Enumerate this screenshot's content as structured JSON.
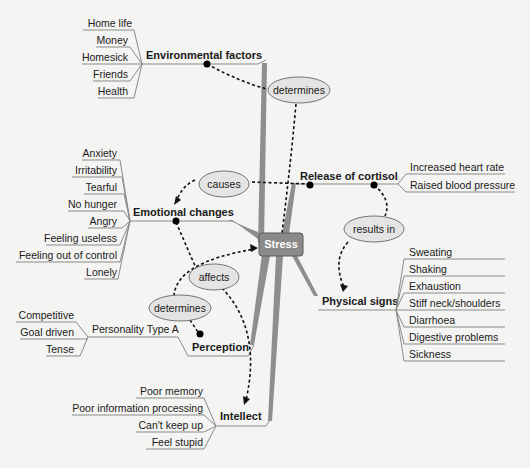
{
  "center": {
    "label": "Stress",
    "fill": "#8a8a8a"
  },
  "branches": {
    "environmental": {
      "label": "Environmental factors",
      "items": [
        "Home life",
        "Money",
        "Homesick",
        "Friends",
        "Health"
      ]
    },
    "emotional": {
      "label": "Emotional changes",
      "items": [
        "Anxiety",
        "Irritability",
        "Tearful",
        "No hunger",
        "Angry",
        "Feeling useless",
        "Feeling out of control",
        "Lonely"
      ]
    },
    "cortisol": {
      "label": "Release of cortisol",
      "items": [
        "Increased heart rate",
        "Raised blood pressure"
      ]
    },
    "physical": {
      "label": "Physical signs",
      "items": [
        "Sweating",
        "Shaking",
        "Exhaustion",
        "Stiff neck/shoulders",
        "Diarrhoea",
        "Digestive problems",
        "Sickness"
      ]
    },
    "perception": {
      "label": "Perception",
      "sub_label": "Personality Type A",
      "items": [
        "Competitive",
        "Goal driven",
        "Tense"
      ]
    },
    "intellect": {
      "label": "Intellect",
      "items": [
        "Poor  memory",
        "Poor information processing",
        "Can't keep up",
        "Feel stupid"
      ]
    }
  },
  "relations": {
    "determines_top": "determines",
    "causes": "causes",
    "results_in": "results in",
    "affects": "affects",
    "determines_bottom": "determines"
  }
}
